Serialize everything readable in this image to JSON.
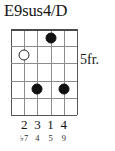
{
  "chord": {
    "name": "E9sus4/D",
    "position_label": "5fr.",
    "strings_count": 6,
    "frets_count": 5,
    "starting_fret": 5,
    "markers": [
      {
        "type": "filled-dot",
        "string": 4,
        "fret": 1,
        "label": ""
      },
      {
        "type": "open-dot",
        "string": 2,
        "fret": 2,
        "label": ""
      },
      {
        "type": "filled-dot",
        "string": 3,
        "fret": 4,
        "label": ""
      },
      {
        "type": "filled-dot",
        "string": 5,
        "fret": 4,
        "label": ""
      }
    ],
    "fingerings": [
      {
        "string": 2,
        "finger": "2"
      },
      {
        "string": 3,
        "finger": "3"
      },
      {
        "string": 4,
        "finger": "1"
      },
      {
        "string": 5,
        "finger": "4"
      }
    ],
    "intervals": [
      {
        "string": 2,
        "degree": "♭7"
      },
      {
        "string": 3,
        "degree": "4"
      },
      {
        "string": 4,
        "degree": "5"
      },
      {
        "string": 5,
        "degree": "9"
      }
    ],
    "colors": {
      "background": "#ffffff",
      "text": "#141414",
      "grid": "#8c8c8c",
      "grid_edge": "#555555",
      "dot_fill": "#111111",
      "dot_open_border": "#262626"
    }
  }
}
